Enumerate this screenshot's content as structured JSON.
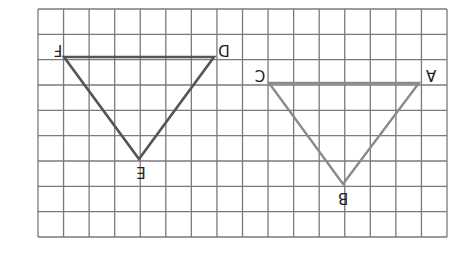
{
  "grid": {
    "left": 38,
    "top": 9,
    "right": 447,
    "bottom": 237,
    "cols": 16,
    "rows": 9,
    "line_color": "#7a7a7a"
  },
  "triangles": [
    {
      "name": "DEF",
      "color": "#555555",
      "points": [
        [
          64,
          57
        ],
        [
          214,
          57
        ],
        [
          139,
          159
        ]
      ],
      "labels": [
        {
          "text": "F",
          "x": 58,
          "y": 50
        },
        {
          "text": "D",
          "x": 224,
          "y": 50
        },
        {
          "text": "E",
          "x": 141,
          "y": 168
        }
      ]
    },
    {
      "name": "ABC",
      "color": "#8a8a8a",
      "points": [
        [
          269,
          83
        ],
        [
          419,
          83
        ],
        [
          343,
          184
        ]
      ],
      "labels": [
        {
          "text": "C",
          "x": 260,
          "y": 75
        },
        {
          "text": "A",
          "x": 431,
          "y": 75
        },
        {
          "text": "B",
          "x": 343,
          "y": 194
        }
      ]
    }
  ]
}
